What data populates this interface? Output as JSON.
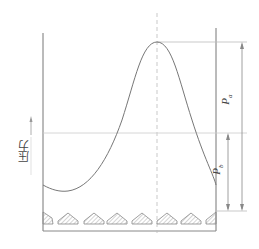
{
  "diagram": {
    "type": "pressure-distribution",
    "y_axis_label": "压力",
    "dimensions": [
      {
        "symbol": "P",
        "subscript": "a",
        "meaning": "peak pressure above baseline"
      },
      {
        "symbol": "P",
        "subscript": "b",
        "meaning": "mid pressure above baseline"
      }
    ],
    "elements": {
      "walls": "left and right vertical boundaries with bottom line",
      "centerline": "dashed vertical line through peak",
      "curve": "bell-shaped pressure curve with peak at center",
      "teeth_count": 8
    },
    "colors": {
      "line": "#777777",
      "light_line": "#bbbbbb",
      "hatch": "#999999"
    }
  }
}
